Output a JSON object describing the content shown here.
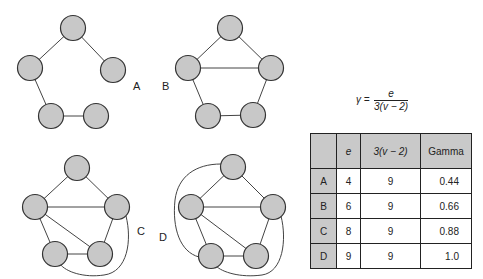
{
  "graphs": [
    {
      "label": "A",
      "nodes": [
        "top",
        "left",
        "right",
        "bottom-left",
        "bottom-right"
      ],
      "edges": [
        [
          "top",
          "left"
        ],
        [
          "top",
          "right"
        ],
        [
          "left",
          "bottom-left"
        ],
        [
          "bottom-left",
          "bottom-right"
        ]
      ],
      "edge_count": 4
    },
    {
      "label": "B",
      "nodes": [
        "top",
        "left",
        "right",
        "bottom-left",
        "bottom-right"
      ],
      "edges": [
        [
          "top",
          "left"
        ],
        [
          "top",
          "right"
        ],
        [
          "left",
          "right"
        ],
        [
          "left",
          "bottom-left"
        ],
        [
          "right",
          "bottom-right"
        ],
        [
          "bottom-left",
          "bottom-right"
        ]
      ],
      "edge_count": 6
    },
    {
      "label": "C",
      "nodes": [
        "top",
        "left",
        "right",
        "bottom-left",
        "bottom-right"
      ],
      "edges": [
        [
          "top",
          "left"
        ],
        [
          "top",
          "right"
        ],
        [
          "left",
          "right"
        ],
        [
          "left",
          "bottom-left"
        ],
        [
          "left",
          "bottom-right"
        ],
        [
          "bottom-left",
          "bottom-right"
        ],
        [
          "right",
          "bottom-right"
        ],
        [
          "right",
          "bottom-left"
        ]
      ],
      "edge_count": 8
    },
    {
      "label": "D",
      "nodes": [
        "top",
        "left",
        "right",
        "bottom-left",
        "bottom-right"
      ],
      "edges": [
        [
          "top",
          "left"
        ],
        [
          "top",
          "right"
        ],
        [
          "left",
          "right"
        ],
        [
          "left",
          "bottom-left"
        ],
        [
          "left",
          "bottom-right"
        ],
        [
          "bottom-left",
          "bottom-right"
        ],
        [
          "right",
          "bottom-right"
        ],
        [
          "right",
          "bottom-left"
        ],
        [
          "top",
          "bottom-left"
        ]
      ],
      "edge_count": 9
    }
  ],
  "formula": {
    "lhs": "γ =",
    "numerator": "e",
    "denominator": "3(v − 2)"
  },
  "table": {
    "headers": [
      "",
      "e",
      "3(v − 2)",
      "Gamma"
    ],
    "rows": [
      {
        "graph": "A",
        "e": "4",
        "max": "9",
        "gamma": "0.44"
      },
      {
        "graph": "B",
        "e": "6",
        "max": "9",
        "gamma": "0.66"
      },
      {
        "graph": "C",
        "e": "8",
        "max": "9",
        "gamma": "0.88"
      },
      {
        "graph": "D",
        "e": "9",
        "max": "9",
        "gamma": "1.0"
      }
    ]
  }
}
